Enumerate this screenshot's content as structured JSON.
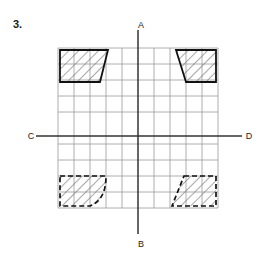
{
  "figure": {
    "problem_number": "3.",
    "type": "coordinate-grid-symmetry-diagram",
    "axis_labels": {
      "top": "A",
      "bottom": "B",
      "left": "C",
      "right": "D"
    },
    "grid": {
      "columns": 10,
      "rows": 10,
      "cell_px": 16,
      "left": 58,
      "top": 48,
      "line_color": "#9a9a9a",
      "background": "#ffffff"
    },
    "axes": {
      "vertical_name": "A-B",
      "horizontal_name": "C-D",
      "color": "#333333",
      "center_x": 138,
      "center_y": 128
    },
    "shapes": [
      {
        "name": "top-left-trapezoid",
        "quadrant": "top-left",
        "border_style": "solid",
        "border_color": "#1a1a1a",
        "fill": "hatched",
        "hatch_color": "#777777",
        "edge_type": "straight-slant-right"
      },
      {
        "name": "top-right-trapezoid",
        "quadrant": "top-right",
        "border_style": "solid",
        "border_color": "#1a1a1a",
        "fill": "hatched",
        "hatch_color": "#777777",
        "edge_type": "straight-slant-left"
      },
      {
        "name": "bottom-left-curved-shape",
        "quadrant": "bottom-left",
        "border_style": "dashed",
        "border_color": "#1a1a1a",
        "fill": "hatched",
        "hatch_color": "#777777",
        "edge_type": "convex-arc-right"
      },
      {
        "name": "bottom-right-parallelogram",
        "quadrant": "bottom-right",
        "border_style": "dashed",
        "border_color": "#1a1a1a",
        "fill": "hatched",
        "hatch_color": "#777777",
        "edge_type": "straight-slant-left"
      }
    ]
  }
}
